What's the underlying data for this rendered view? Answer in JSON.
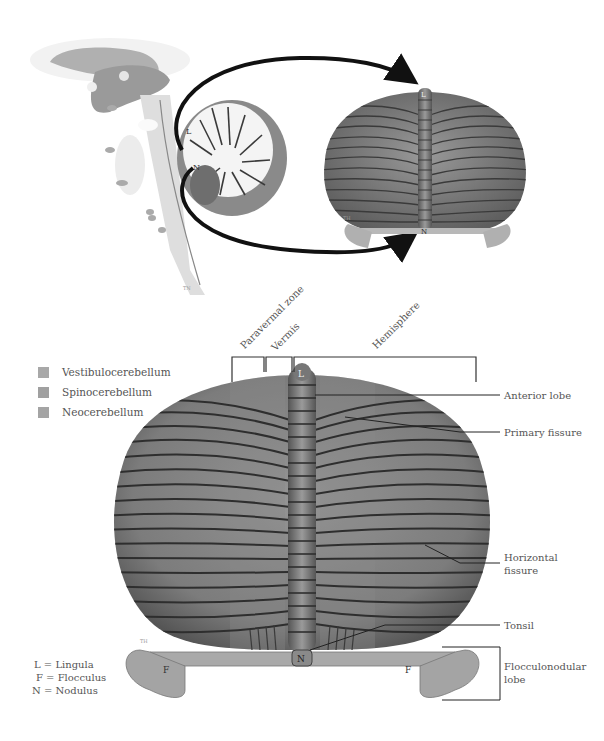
{
  "figure": {
    "top_left_panel": {
      "description": "Midsagittal view of brainstem and cerebellum",
      "markers": {
        "lingula": "L",
        "nodulus": "N"
      },
      "watermark": "TN"
    },
    "top_right_panel": {
      "description": "Posterior view of cerebellum (small)",
      "markers": {
        "lingula": "L",
        "nodulus": "N"
      },
      "watermark": "TH"
    },
    "arrows": [
      {
        "from": "lingula-sagittal",
        "to": "lingula-posterior"
      },
      {
        "from": "nodulus-sagittal",
        "to": "nodulus-posterior"
      }
    ]
  },
  "legend": {
    "items": [
      {
        "label": "Vestibulocerebellum",
        "color": "#a8a8a8"
      },
      {
        "label": "Spinocerebellum",
        "color": "#a0a0a0"
      },
      {
        "label": "Neocerebellum",
        "color": "#a4a4a4"
      }
    ]
  },
  "zones": {
    "paravermal": "Paravermal zone",
    "vermis": "Vermis",
    "hemisphere": "Hemisphere"
  },
  "main_markers": {
    "lingula": "L",
    "nodulus": "N",
    "flocculus_left": "F",
    "flocculus_right": "F",
    "watermark": "TH"
  },
  "callouts": {
    "anterior_lobe": "Anterior lobe",
    "primary_fissure": "Primary fissure",
    "horizontal_fissure_line1": "Horizontal",
    "horizontal_fissure_line2": "fissure",
    "tonsil": "Tonsil",
    "flocculonodular_line1": "Flocculonodular",
    "flocculonodular_line2": "lobe"
  },
  "key": {
    "lingula": "L = Lingula",
    "flocculus": "F = Flocculus",
    "nodulus": "N = Nodulus"
  },
  "colors": {
    "folia_fill": "#7a7a7a",
    "folia_groove": "#2e2e2e",
    "vermis_fill": "#858585",
    "arrow": "#111111",
    "leader": "#222222"
  }
}
